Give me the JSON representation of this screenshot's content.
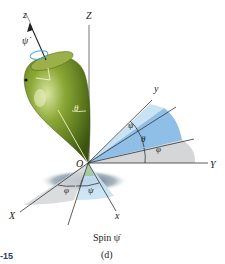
{
  "figure": {
    "caption": "Spin ψ̇",
    "panel": "(d)",
    "figure_number_fragment": "-15"
  },
  "labels": {
    "Z_axis": "Z",
    "z_axis": "z",
    "psi_dot": "ψ̇",
    "theta_top": "θ",
    "y_axis": "y",
    "Y_axis": "Y",
    "psi_upper": "ψ",
    "theta_right": "θ",
    "phi_right": "φ",
    "origin": "O",
    "phi_lower": "φ",
    "psi_lower": "ψ",
    "X_axis": "X",
    "x_axis": "x"
  },
  "colors": {
    "top_body": "#7e9a2c",
    "top_dark": "#4f6a12",
    "blue_sector": "#8fbfe6",
    "light_blue_sector": "#c9e2f4",
    "gray_sector": "#d4d6d8",
    "shadow": "#5d7488",
    "axis_line": "#333333",
    "spin_ring": "#4aa3d8"
  }
}
